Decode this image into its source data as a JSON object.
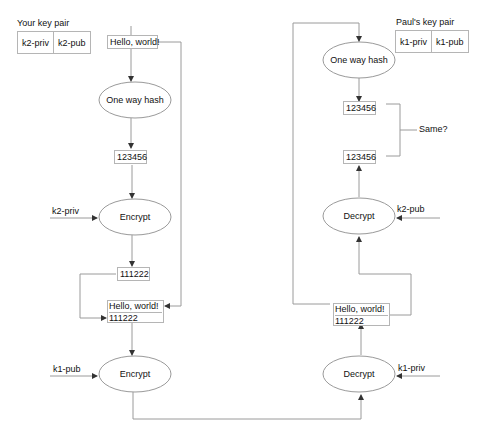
{
  "sender": {
    "title": "Your key pair",
    "keys": [
      "k2-priv",
      "k2-pub"
    ],
    "message": "Hello, world!",
    "hash_step": "One way hash",
    "hash_value": "123456",
    "sign_key": "k2-priv",
    "sign_step": "Encrypt",
    "signature": "111222",
    "bundle": [
      "Hello, world!",
      "111222"
    ],
    "encrypt_key": "k1-pub",
    "encrypt_step": "Encrypt"
  },
  "receiver": {
    "title": "Paul's key pair",
    "keys": [
      "k1-priv",
      "k1-pub"
    ],
    "decrypt_key": "k1-priv",
    "decrypt_step": "Decrypt",
    "bundle": [
      "Hello, world!",
      "111222"
    ],
    "verify_key": "k2-pub",
    "verify_step": "Decrypt",
    "decrypted_hash": "123456",
    "hash_step": "One way hash",
    "computed_hash": "123456",
    "compare_label": "Same?"
  },
  "colors": {
    "line": "#9a9a9a",
    "box_border": "#b5b5b5",
    "text": "#111111"
  }
}
